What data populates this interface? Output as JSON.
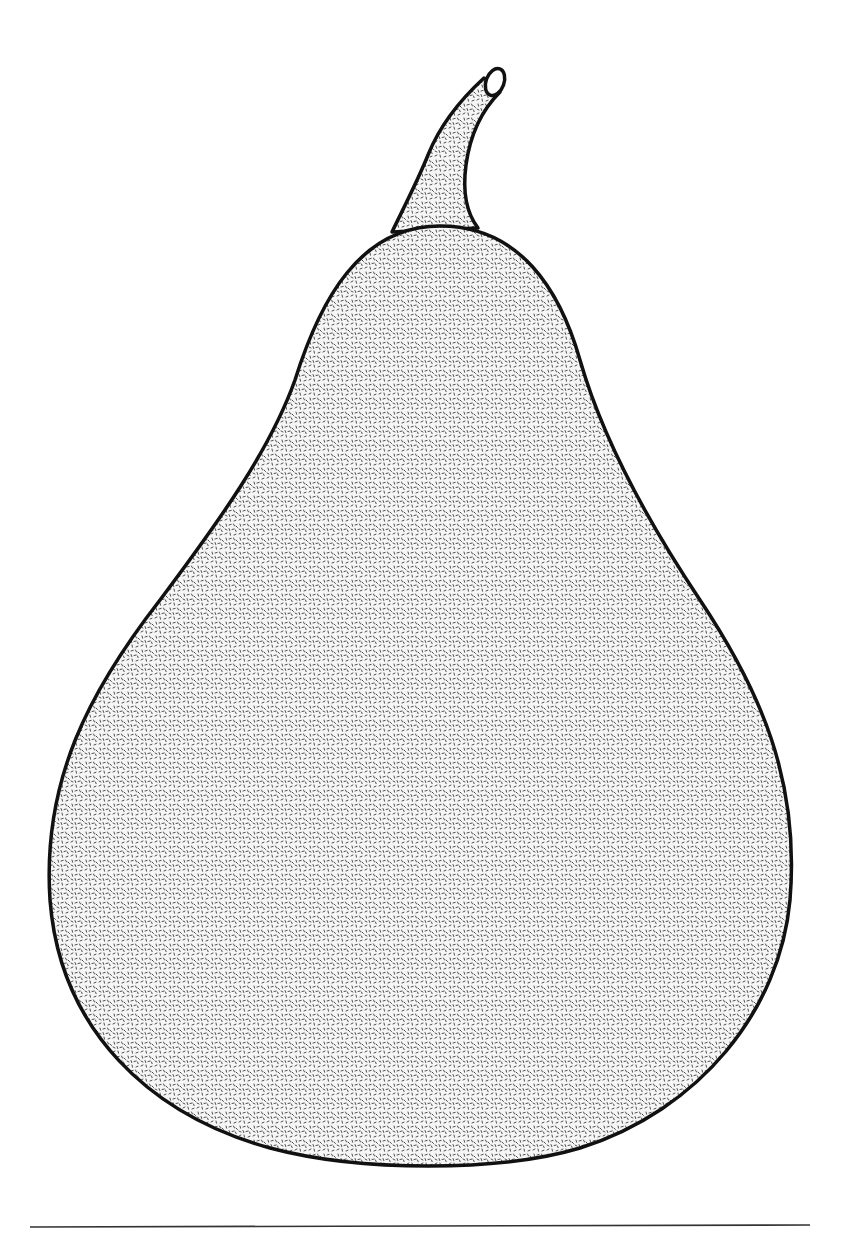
{
  "illustration": {
    "subject": "pear",
    "style": "stippled line drawing",
    "colors": {
      "background": "#ffffff",
      "outline": "#111111",
      "stipple": "#3a3a3a",
      "fill_base": "#f4f4f4",
      "rule": "#333333"
    },
    "parts": [
      "stem",
      "stem-tip",
      "body",
      "baseline-rule"
    ]
  }
}
